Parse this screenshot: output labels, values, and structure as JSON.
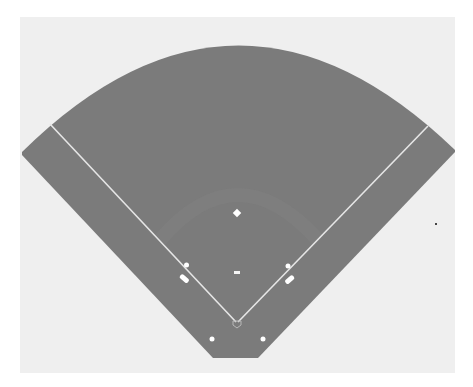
{
  "diagram": {
    "type": "baseball-field",
    "colors": {
      "page": "#ffffff",
      "panel": "#efefef",
      "field": "#7b7b7b",
      "infield_arc": "#818181",
      "lines": "#e8e8e8",
      "markers": "#ffffff",
      "stray_dot": "#444444"
    },
    "elements": [
      {
        "name": "second-base",
        "shape": "diamond"
      },
      {
        "name": "pitchers-rubber",
        "shape": "rect"
      },
      {
        "name": "first-base",
        "shape": "circle"
      },
      {
        "name": "third-base",
        "shape": "circle"
      },
      {
        "name": "first-base-coach-box",
        "shape": "rounded-rect"
      },
      {
        "name": "third-base-coach-box",
        "shape": "rounded-rect"
      },
      {
        "name": "home-plate",
        "shape": "pentagon"
      },
      {
        "name": "left-on-deck-circle",
        "shape": "circle"
      },
      {
        "name": "right-on-deck-circle",
        "shape": "circle"
      },
      {
        "name": "left-foul-line",
        "shape": "line"
      },
      {
        "name": "right-foul-line",
        "shape": "line"
      }
    ]
  }
}
